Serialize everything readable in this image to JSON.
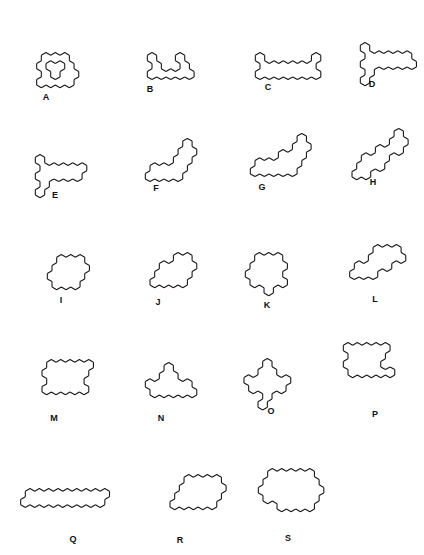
{
  "figure": {
    "stroke_color": "#1a1a1a",
    "background": "#ffffff",
    "hex_edge": 5.4,
    "shapes": [
      {
        "label": "A",
        "cx": 46,
        "cy": 58,
        "lx": 46,
        "ly": 92,
        "cells": [
          [
            0,
            0
          ],
          [
            1,
            0
          ],
          [
            2,
            0
          ],
          [
            -1,
            1
          ],
          [
            2,
            1
          ],
          [
            -1,
            2
          ],
          [
            1,
            2
          ],
          [
            2,
            2
          ],
          [
            -2,
            3
          ],
          [
            -1,
            3
          ],
          [
            0,
            3
          ],
          [
            1,
            3
          ]
        ]
      },
      {
        "label": "B",
        "cx": 152,
        "cy": 58,
        "lx": 150,
        "ly": 84,
        "cells": [
          [
            0,
            0
          ],
          [
            3,
            0
          ],
          [
            0,
            1
          ],
          [
            3,
            1
          ],
          [
            -1,
            2
          ],
          [
            0,
            2
          ],
          [
            1,
            2
          ],
          [
            2,
            2
          ],
          [
            3,
            2
          ]
        ]
      },
      {
        "label": "C",
        "cx": 260,
        "cy": 58,
        "lx": 268,
        "ly": 82,
        "cells": [
          [
            0,
            0
          ],
          [
            6,
            0
          ],
          [
            0,
            1
          ],
          [
            1,
            1
          ],
          [
            2,
            1
          ],
          [
            3,
            1
          ],
          [
            4,
            1
          ],
          [
            5,
            1
          ],
          [
            5,
            1
          ],
          [
            -1,
            2
          ],
          [
            0,
            2
          ],
          [
            1,
            2
          ],
          [
            2,
            2
          ],
          [
            3,
            2
          ],
          [
            4,
            2
          ],
          [
            5,
            2
          ]
        ]
      },
      {
        "label": "D",
        "cx": 365,
        "cy": 48,
        "lx": 372,
        "ly": 79,
        "cells": [
          [
            0,
            0
          ],
          [
            0,
            1
          ],
          [
            1,
            1
          ],
          [
            2,
            1
          ],
          [
            3,
            1
          ],
          [
            4,
            1
          ],
          [
            -1,
            2
          ],
          [
            4,
            2
          ],
          [
            0,
            2
          ],
          [
            1,
            2
          ],
          [
            2,
            2
          ],
          [
            3,
            2
          ],
          [
            -1,
            3
          ],
          [
            -2,
            4
          ]
        ]
      },
      {
        "label": "E",
        "cx": 40,
        "cy": 160,
        "lx": 55,
        "ly": 190,
        "cells": [
          [
            0,
            0
          ],
          [
            0,
            1
          ],
          [
            1,
            1
          ],
          [
            2,
            1
          ],
          [
            3,
            1
          ],
          [
            4,
            1
          ],
          [
            -1,
            2
          ],
          [
            0,
            2
          ],
          [
            1,
            2
          ],
          [
            2,
            2
          ],
          [
            3,
            2
          ],
          [
            -1,
            3
          ],
          [
            -2,
            4
          ]
        ]
      },
      {
        "label": "F",
        "cx": 150,
        "cy": 160,
        "lx": 156,
        "ly": 183,
        "cells": [
          [
            5,
            -2
          ],
          [
            4,
            -1
          ],
          [
            5,
            -1
          ],
          [
            3,
            0
          ],
          [
            4,
            0
          ],
          [
            0,
            1
          ],
          [
            1,
            1
          ],
          [
            2,
            1
          ],
          [
            3,
            1
          ],
          [
            -1,
            2
          ],
          [
            0,
            2
          ],
          [
            1,
            2
          ],
          [
            2,
            2
          ]
        ]
      },
      {
        "label": "G",
        "cx": 255,
        "cy": 155,
        "lx": 262,
        "ly": 182,
        "cells": [
          [
            6,
            -2
          ],
          [
            5,
            -1
          ],
          [
            6,
            -1
          ],
          [
            3,
            0
          ],
          [
            4,
            0
          ],
          [
            5,
            0
          ],
          [
            0,
            1
          ],
          [
            1,
            1
          ],
          [
            2,
            1
          ],
          [
            3,
            1
          ],
          [
            4,
            1
          ],
          [
            -1,
            2
          ],
          [
            0,
            2
          ],
          [
            1,
            2
          ],
          [
            2,
            2
          ],
          [
            3,
            2
          ]
        ]
      },
      {
        "label": "H",
        "cx": 352,
        "cy": 150,
        "lx": 373,
        "ly": 177,
        "cells": [
          [
            6,
            -2
          ],
          [
            5,
            -1
          ],
          [
            6,
            -1
          ],
          [
            3,
            0
          ],
          [
            4,
            0
          ],
          [
            5,
            0
          ],
          [
            1,
            1
          ],
          [
            2,
            1
          ],
          [
            3,
            1
          ],
          [
            0,
            2
          ],
          [
            1,
            2
          ],
          [
            2,
            2
          ],
          [
            -1,
            3
          ],
          [
            0,
            3
          ]
        ]
      },
      {
        "label": "I",
        "cx": 52,
        "cy": 260,
        "lx": 61,
        "ly": 295,
        "cells": [
          [
            1,
            0
          ],
          [
            2,
            0
          ],
          [
            3,
            0
          ],
          [
            0,
            1
          ],
          [
            1,
            1
          ],
          [
            2,
            1
          ],
          [
            3,
            1
          ],
          [
            -1,
            2
          ],
          [
            0,
            2
          ],
          [
            1,
            2
          ],
          [
            2,
            2
          ],
          [
            -1,
            3
          ],
          [
            0,
            3
          ],
          [
            1,
            3
          ]
        ]
      },
      {
        "label": "J",
        "cx": 150,
        "cy": 258,
        "lx": 158,
        "ly": 297,
        "cells": [
          [
            3,
            0
          ],
          [
            4,
            0
          ],
          [
            1,
            1
          ],
          [
            2,
            1
          ],
          [
            3,
            1
          ],
          [
            4,
            1
          ],
          [
            0,
            2
          ],
          [
            1,
            2
          ],
          [
            2,
            2
          ],
          [
            3,
            2
          ],
          [
            -1,
            3
          ],
          [
            0,
            3
          ],
          [
            1,
            3
          ],
          [
            2,
            3
          ]
        ]
      },
      {
        "label": "K",
        "cx": 250,
        "cy": 258,
        "lx": 267,
        "ly": 300,
        "cells": [
          [
            1,
            0
          ],
          [
            2,
            0
          ],
          [
            3,
            0
          ],
          [
            0,
            1
          ],
          [
            1,
            1
          ],
          [
            2,
            1
          ],
          [
            3,
            1
          ],
          [
            -1,
            2
          ],
          [
            0,
            2
          ],
          [
            1,
            2
          ],
          [
            2,
            2
          ],
          [
            -1,
            3
          ],
          [
            0,
            3
          ],
          [
            1,
            3
          ],
          [
            2,
            3
          ],
          [
            0,
            4
          ]
        ]
      },
      {
        "label": "L",
        "cx": 345,
        "cy": 258,
        "lx": 375,
        "ly": 294,
        "cells": [
          [
            4,
            -1
          ],
          [
            5,
            -1
          ],
          [
            6,
            -1
          ],
          [
            3,
            0
          ],
          [
            4,
            0
          ],
          [
            5,
            0
          ],
          [
            6,
            0
          ],
          [
            1,
            1
          ],
          [
            2,
            1
          ],
          [
            3,
            1
          ],
          [
            4,
            1
          ],
          [
            0,
            2
          ],
          [
            1,
            2
          ],
          [
            2,
            2
          ]
        ]
      },
      {
        "label": "M",
        "cx": 42,
        "cy": 365,
        "lx": 54,
        "ly": 413,
        "cells": [
          [
            1,
            0
          ],
          [
            2,
            0
          ],
          [
            3,
            0
          ],
          [
            4,
            0
          ],
          [
            5,
            0
          ],
          [
            0,
            1
          ],
          [
            1,
            1
          ],
          [
            2,
            1
          ],
          [
            3,
            1
          ],
          [
            4,
            1
          ],
          [
            0,
            2
          ],
          [
            1,
            2
          ],
          [
            2,
            2
          ],
          [
            3,
            2
          ],
          [
            -1,
            3
          ],
          [
            0,
            3
          ],
          [
            1,
            3
          ],
          [
            2,
            3
          ],
          [
            3,
            3
          ]
        ]
      },
      {
        "label": "N",
        "cx": 150,
        "cy": 368,
        "lx": 161,
        "ly": 413,
        "cells": [
          [
            2,
            0
          ],
          [
            1,
            1
          ],
          [
            2,
            1
          ],
          [
            -1,
            2
          ],
          [
            0,
            2
          ],
          [
            1,
            2
          ],
          [
            2,
            2
          ],
          [
            3,
            2
          ],
          [
            -1,
            3
          ],
          [
            0,
            3
          ],
          [
            1,
            3
          ],
          [
            2,
            3
          ],
          [
            3,
            3
          ]
        ]
      },
      {
        "label": "O",
        "cx": 258,
        "cy": 364,
        "lx": 271,
        "ly": 406,
        "cells": [
          [
            1,
            0
          ],
          [
            0,
            1
          ],
          [
            1,
            1
          ],
          [
            -2,
            2
          ],
          [
            -1,
            2
          ],
          [
            0,
            2
          ],
          [
            1,
            2
          ],
          [
            2,
            2
          ],
          [
            -2,
            3
          ],
          [
            -1,
            3
          ],
          [
            0,
            3
          ],
          [
            1,
            3
          ],
          [
            -1,
            4
          ],
          [
            -2,
            5
          ]
        ]
      },
      {
        "label": "P",
        "cx": 348,
        "cy": 348,
        "lx": 375,
        "ly": 409,
        "cells": [
          [
            0,
            0
          ],
          [
            1,
            0
          ],
          [
            2,
            0
          ],
          [
            3,
            0
          ],
          [
            4,
            0
          ],
          [
            0,
            1
          ],
          [
            1,
            1
          ],
          [
            2,
            1
          ],
          [
            3,
            1
          ],
          [
            -1,
            2
          ],
          [
            0,
            2
          ],
          [
            1,
            2
          ],
          [
            2,
            2
          ],
          [
            -1,
            3
          ],
          [
            0,
            3
          ],
          [
            1,
            3
          ],
          [
            2,
            3
          ],
          [
            3,
            3
          ]
        ]
      },
      {
        "label": "Q",
        "cx": 30,
        "cy": 494,
        "lx": 73,
        "ly": 534,
        "cells": [
          [
            0,
            0
          ],
          [
            1,
            0
          ],
          [
            2,
            0
          ],
          [
            3,
            0
          ],
          [
            4,
            0
          ],
          [
            5,
            0
          ],
          [
            6,
            0
          ],
          [
            7,
            0
          ],
          [
            8,
            0
          ],
          [
            -1,
            1
          ],
          [
            0,
            1
          ],
          [
            1,
            1
          ],
          [
            2,
            1
          ],
          [
            3,
            1
          ],
          [
            4,
            1
          ],
          [
            5,
            1
          ],
          [
            6,
            1
          ],
          [
            7,
            1
          ]
        ]
      },
      {
        "label": "R",
        "cx": 170,
        "cy": 480,
        "lx": 180,
        "ly": 535,
        "cells": [
          [
            2,
            0
          ],
          [
            3,
            0
          ],
          [
            4,
            0
          ],
          [
            5,
            0
          ],
          [
            1,
            1
          ],
          [
            2,
            1
          ],
          [
            3,
            1
          ],
          [
            4,
            1
          ],
          [
            5,
            1
          ],
          [
            0,
            2
          ],
          [
            1,
            2
          ],
          [
            2,
            2
          ],
          [
            3,
            2
          ],
          [
            4,
            2
          ],
          [
            -1,
            3
          ],
          [
            0,
            3
          ],
          [
            1,
            3
          ],
          [
            2,
            3
          ],
          [
            3,
            3
          ]
        ]
      },
      {
        "label": "S",
        "cx": 263,
        "cy": 474,
        "lx": 288,
        "ly": 533,
        "cells": [
          [
            1,
            0
          ],
          [
            2,
            0
          ],
          [
            3,
            0
          ],
          [
            4,
            0
          ],
          [
            5,
            0
          ],
          [
            0,
            1
          ],
          [
            1,
            1
          ],
          [
            2,
            1
          ],
          [
            3,
            1
          ],
          [
            4,
            1
          ],
          [
            5,
            1
          ],
          [
            -1,
            2
          ],
          [
            0,
            2
          ],
          [
            1,
            2
          ],
          [
            2,
            2
          ],
          [
            3,
            2
          ],
          [
            4,
            2
          ],
          [
            5,
            2
          ],
          [
            -1,
            3
          ],
          [
            0,
            3
          ],
          [
            1,
            3
          ],
          [
            2,
            3
          ],
          [
            3,
            3
          ],
          [
            4,
            3
          ],
          [
            0,
            4
          ],
          [
            1,
            4
          ],
          [
            2,
            4
          ],
          [
            3,
            4
          ]
        ]
      }
    ]
  }
}
